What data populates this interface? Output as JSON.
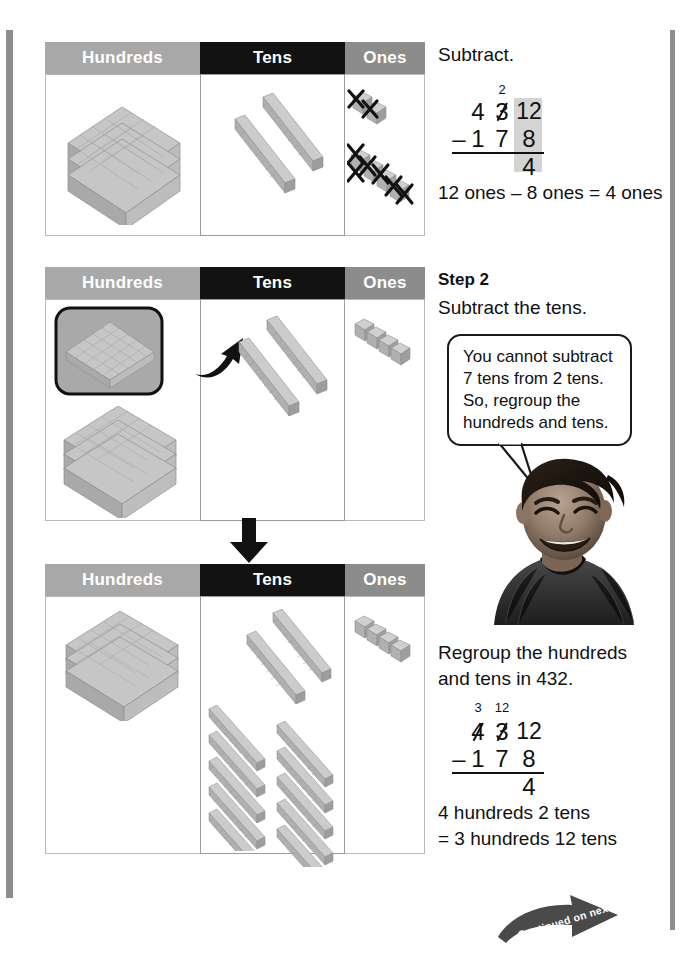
{
  "page": {
    "width": 693,
    "height": 958,
    "background": "#ffffff",
    "margin_rule_color": "#8d8d8d"
  },
  "colors": {
    "header_hundreds": "#a8a8a8",
    "header_tens": "#121212",
    "header_ones": "#8c8c8c",
    "header_text": "#ffffff",
    "highlight_gray": "#d4d4d4",
    "block_gray": "#b6b6b6",
    "ink": "#111111"
  },
  "tables": [
    {
      "id": "table-step1",
      "headers": [
        "Hundreds",
        "Tens",
        "Ones"
      ],
      "hundreds_flats": 1,
      "tens_rods": 2,
      "ones_cubes": 8,
      "ones_crossed_out": 8,
      "note": "8 ones crossed out with X marks"
    },
    {
      "id": "table-step2",
      "headers": [
        "Hundreds",
        "Tens",
        "Ones"
      ],
      "hundreds_flats": 4,
      "hundreds_highlighted": 1,
      "tens_rods": 2,
      "ones_cubes": 4,
      "note": "one hundred flat boxed and arrow points to tens column"
    },
    {
      "id": "table-step3",
      "headers": [
        "Hundreds",
        "Tens",
        "Ones"
      ],
      "hundreds_flats": 3,
      "tens_rods": 12,
      "ones_cubes": 4,
      "note": "regrouped: 3 hundreds and 12 tens"
    }
  ],
  "right_column": {
    "step1": {
      "instruction": "Subtract.",
      "problem": {
        "regroup_above_tens": "2",
        "minuend": [
          "4",
          "3",
          "12"
        ],
        "minuend_tens_crossed": true,
        "operator": "–",
        "subtrahend": [
          "1",
          "7",
          "8"
        ],
        "difference_ones": "4",
        "highlight_column": "ones"
      },
      "sentence": "12 ones – 8 ones = 4 ones"
    },
    "step2": {
      "label": "Step 2",
      "instruction": "Subtract the tens.",
      "callout": [
        "You cannot subtract",
        "7 tens from 2 tens.",
        "So, regroup the",
        "hundreds and tens."
      ],
      "photo_alt": "smiling boy"
    },
    "step3": {
      "instruction_lines": [
        "Regroup the hundreds",
        "and tens in 432."
      ],
      "problem": {
        "regroup_above_hundreds": "3",
        "regroup_above_tens": "12",
        "minuend": [
          "4",
          "3",
          "12"
        ],
        "minuend_hundreds_crossed": true,
        "minuend_tens_crossed": true,
        "operator": "–",
        "subtrahend": [
          "1",
          "7",
          "8"
        ],
        "difference_ones": "4"
      },
      "sentence_lines": [
        "4 hundreds 2 tens",
        "= 3 hundreds 12 tens"
      ]
    }
  },
  "footer": {
    "continued_label": "Continued on next page"
  }
}
